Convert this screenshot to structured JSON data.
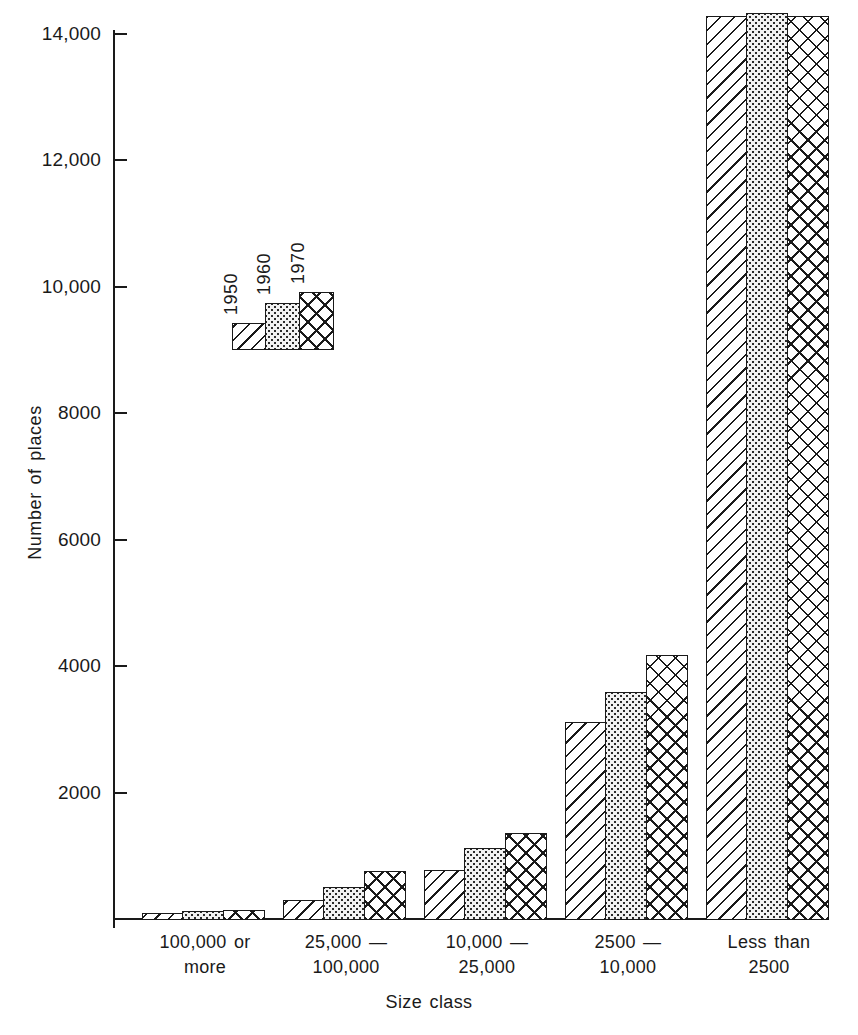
{
  "chart_data": {
    "type": "bar",
    "title": "",
    "xlabel": "Size class",
    "ylabel": "Number of places",
    "categories": [
      "100,000 or more",
      "25,000 — 100,000",
      "10,000 — 25,000",
      "2500 — 10,000",
      "Less than 2500"
    ],
    "category_lines": [
      [
        "100,000 or",
        "more"
      ],
      [
        "25,000 —",
        "100,000"
      ],
      [
        "10,000 —",
        "25,000"
      ],
      [
        "2500 —",
        "10,000"
      ],
      [
        "Less than",
        "2500"
      ]
    ],
    "series": [
      {
        "name": "1950",
        "values": [
          105,
          310,
          790,
          3140,
          14300
        ]
      },
      {
        "name": "1960",
        "values": [
          145,
          520,
          1140,
          3600,
          14350
        ]
      },
      {
        "name": "1970",
        "values": [
          155,
          780,
          1380,
          4200,
          14300
        ]
      }
    ],
    "ylim": [
      0,
      14340
    ],
    "yticks": [
      2000,
      4000,
      6000,
      8000,
      10000,
      12000,
      14000
    ],
    "ytick_labels": [
      "2000",
      "4000",
      "6000",
      "8000",
      "10,000",
      "12,000",
      "14,000"
    ],
    "grid": false,
    "legend_position": "inside-upper-left",
    "legend_entries": [
      "1950",
      "1960",
      "1970"
    ],
    "fills": {
      "1950": "diagonal-hatch",
      "1960": "dotted-stipple",
      "1970": "cross-hatch"
    },
    "colors": {
      "ink": "#1a1a1a",
      "background": "#ffffff",
      "stipple_background": "#f2f2f2"
    }
  },
  "axes": {
    "y_title": "Number of places",
    "x_title": "Size class",
    "y_tick_labels": [
      "14,000",
      "12,000",
      "10,000",
      "8000",
      "6000",
      "4000",
      "2000"
    ]
  },
  "legend": {
    "items": [
      {
        "label": "1950"
      },
      {
        "label": "1960"
      },
      {
        "label": "1970"
      }
    ]
  }
}
